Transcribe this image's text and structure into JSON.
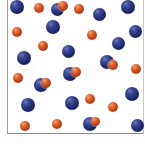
{
  "figure": {
    "background_color": "#ffffff",
    "border_color": "#8e8e8e",
    "blue_color": "#232e74",
    "orange_color": "#c8481c",
    "counts": {
      "blue": 21,
      "orange": 17,
      "total": 38
    },
    "container": {
      "left": 7,
      "top": -4,
      "width": 137,
      "height": 138,
      "open_top": true
    }
  },
  "particles": [
    {
      "id": "p01",
      "type": "blue",
      "x": 17,
      "y": 7,
      "d": 14
    },
    {
      "id": "p02",
      "type": "orange",
      "x": 39,
      "y": 8,
      "d": 10
    },
    {
      "id": "p03",
      "type": "blue",
      "x": 57,
      "y": 9,
      "d": 13
    },
    {
      "id": "p04",
      "type": "orange",
      "x": 63,
      "y": 6,
      "d": 10
    },
    {
      "id": "p05",
      "type": "orange",
      "x": 79,
      "y": 9,
      "d": 10
    },
    {
      "id": "p06",
      "type": "blue",
      "x": 99,
      "y": 14,
      "d": 13
    },
    {
      "id": "p07",
      "type": "blue",
      "x": 128,
      "y": 7,
      "d": 14
    },
    {
      "id": "p08",
      "type": "orange",
      "x": 17,
      "y": 32,
      "d": 10
    },
    {
      "id": "p09",
      "type": "blue",
      "x": 53,
      "y": 27,
      "d": 14
    },
    {
      "id": "p10",
      "type": "orange",
      "x": 92,
      "y": 35,
      "d": 10
    },
    {
      "id": "p11",
      "type": "blue",
      "x": 135,
      "y": 31,
      "d": 13
    },
    {
      "id": "p12",
      "type": "orange",
      "x": 43,
      "y": 46,
      "d": 10
    },
    {
      "id": "p13",
      "type": "blue",
      "x": 118,
      "y": 43,
      "d": 13
    },
    {
      "id": "p14",
      "type": "blue",
      "x": 68,
      "y": 51,
      "d": 13
    },
    {
      "id": "p15",
      "type": "blue",
      "x": 24,
      "y": 58,
      "d": 14
    },
    {
      "id": "p16",
      "type": "blue",
      "x": 107,
      "y": 62,
      "d": 14
    },
    {
      "id": "p17",
      "type": "orange",
      "x": 113,
      "y": 65,
      "d": 10
    },
    {
      "id": "p18",
      "type": "orange",
      "x": 136,
      "y": 69,
      "d": 10
    },
    {
      "id": "p19",
      "type": "orange",
      "x": 18,
      "y": 78,
      "d": 10
    },
    {
      "id": "p20",
      "type": "blue",
      "x": 70,
      "y": 74,
      "d": 14
    },
    {
      "id": "p21",
      "type": "orange",
      "x": 76,
      "y": 72,
      "d": 10
    },
    {
      "id": "p22",
      "type": "blue",
      "x": 41,
      "y": 85,
      "d": 14
    },
    {
      "id": "p23",
      "type": "orange",
      "x": 46,
      "y": 83,
      "d": 10
    },
    {
      "id": "p24",
      "type": "blue",
      "x": 28,
      "y": 105,
      "d": 14
    },
    {
      "id": "p25",
      "type": "blue",
      "x": 72,
      "y": 103,
      "d": 14
    },
    {
      "id": "p26",
      "type": "orange",
      "x": 90,
      "y": 99,
      "d": 10
    },
    {
      "id": "p27",
      "type": "orange",
      "x": 113,
      "y": 107,
      "d": 10
    },
    {
      "id": "p28",
      "type": "blue",
      "x": 132,
      "y": 94,
      "d": 14
    },
    {
      "id": "p29",
      "type": "orange",
      "x": 25,
      "y": 126,
      "d": 10
    },
    {
      "id": "p30",
      "type": "orange",
      "x": 57,
      "y": 124,
      "d": 10
    },
    {
      "id": "p31",
      "type": "blue",
      "x": 90,
      "y": 124,
      "d": 14
    },
    {
      "id": "p32",
      "type": "orange",
      "x": 95,
      "y": 121,
      "d": 9
    },
    {
      "id": "p33",
      "type": "blue",
      "x": 137,
      "y": 125,
      "d": 13
    }
  ]
}
